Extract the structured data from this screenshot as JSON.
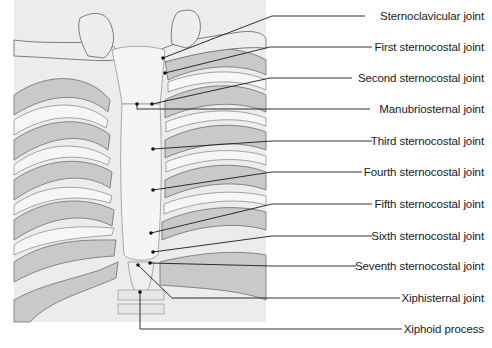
{
  "figure": {
    "colors": {
      "background_panel": "#ececec",
      "rib_shade": "#c9c9c9",
      "bone_light": "#f4f4f4",
      "outline": "#6e6e6e",
      "leader_line": "#1a1a1a"
    },
    "labels": [
      {
        "id": "sternoclavicular",
        "text": "Sternoclavicular joint",
        "y": 16
      },
      {
        "id": "first-sternocostal",
        "text": "First sternocostal joint",
        "y": 47
      },
      {
        "id": "second-sternocostal",
        "text": "Second sternocostal joint",
        "y": 78
      },
      {
        "id": "manubriosternal",
        "text": "Manubriosternal joint",
        "y": 109
      },
      {
        "id": "third-sternocostal",
        "text": "Third sternocostal joint",
        "y": 141
      },
      {
        "id": "fourth-sternocostal",
        "text": "Fourth sternocostal joint",
        "y": 172
      },
      {
        "id": "fifth-sternocostal",
        "text": "Fifth sternocostal joint",
        "y": 204
      },
      {
        "id": "sixth-sternocostal",
        "text": "Sixth sternocostal joint",
        "y": 236
      },
      {
        "id": "seventh-sternocostal",
        "text": "Seventh sternocostal joint",
        "y": 266
      },
      {
        "id": "xiphisternal",
        "text": "Xiphisternal joint",
        "y": 298
      },
      {
        "id": "xiphoid-process",
        "text": "Xiphoid process",
        "y": 329
      }
    ]
  }
}
